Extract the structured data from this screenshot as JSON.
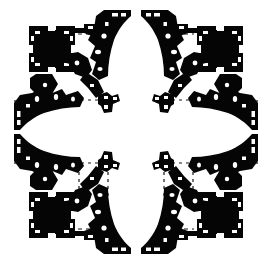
{
  "document": {
    "type": "architectural-floor-plan",
    "title": "Centralized Greek-cross church plan",
    "rendering": "poche",
    "symmetry": "four-fold mirror (vertical and horizontal axes)",
    "colors": {
      "background": "#ffffff",
      "masonry_poche": "#050505",
      "axis_line": "#151515",
      "thin_line": "#2a2a2a"
    },
    "canvas": {
      "width": 272,
      "height": 264
    }
  },
  "plan": {
    "center": {
      "x": 136,
      "y": 132
    },
    "elements": {
      "corner_chapel": "square chapel with four thick corner piers",
      "cross_arm": "curved apsidal arm projecting on each axis",
      "central_pier": "free-standing L-shaped pier block",
      "axis_line": "dashed construction/axis line",
      "niche": "small white recess within pier"
    },
    "labels": {
      "corner_chapel_nw": "corner-chapel-northwest",
      "corner_chapel_ne": "corner-chapel-northeast",
      "corner_chapel_sw": "corner-chapel-southwest",
      "corner_chapel_se": "corner-chapel-southeast",
      "arm_n": "cross-arm-north",
      "arm_s": "cross-arm-south",
      "arm_e": "cross-arm-east",
      "arm_w": "cross-arm-west",
      "crossing": "central-crossing"
    }
  },
  "geometry": {
    "corner_chapel_nw": {
      "chapel_square": {
        "x": 30,
        "y": 27,
        "w": 44,
        "h": 44
      },
      "piers": [
        {
          "x": 30,
          "y": 27,
          "w": 15,
          "h": 15
        },
        {
          "x": 59,
          "y": 27,
          "w": 15,
          "h": 15
        },
        {
          "x": 30,
          "y": 56,
          "w": 15,
          "h": 15
        },
        {
          "x": 59,
          "y": 56,
          "w": 15,
          "h": 15
        }
      ]
    },
    "central_piers": [
      {
        "x": 98,
        "y": 93,
        "w": 21,
        "h": 20,
        "rot": 0
      },
      {
        "x": 153,
        "y": 93,
        "w": 21,
        "h": 20,
        "rot": 90
      },
      {
        "x": 98,
        "y": 151,
        "w": 21,
        "h": 20,
        "rot": 270
      },
      {
        "x": 153,
        "y": 151,
        "w": 21,
        "h": 20,
        "rot": 180
      }
    ],
    "arm_extents": {
      "north_tip_y": 10,
      "south_tip_y": 252,
      "west_tip_x": 14,
      "east_tip_x": 258
    },
    "axis_lines": [
      {
        "name": "north-upper-left",
        "x1": 78,
        "y1": 34,
        "x2": 104,
        "y2": 34
      },
      {
        "name": "north-upper-right",
        "x1": 168,
        "y1": 34,
        "x2": 194,
        "y2": 34
      },
      {
        "name": "south-lower-left",
        "x1": 78,
        "y1": 229,
        "x2": 104,
        "y2": 229
      },
      {
        "name": "south-lower-right",
        "x1": 168,
        "y1": 229,
        "x2": 194,
        "y2": 229
      },
      {
        "name": "west-inner-upper",
        "x1": 37,
        "y1": 74,
        "x2": 37,
        "y2": 96
      },
      {
        "name": "east-inner-upper",
        "x1": 235,
        "y1": 74,
        "x2": 235,
        "y2": 96
      },
      {
        "name": "west-inner-lower",
        "x1": 37,
        "y1": 168,
        "x2": 37,
        "y2": 192
      },
      {
        "name": "east-inner-lower",
        "x1": 235,
        "y1": 168,
        "x2": 235,
        "y2": 192
      },
      {
        "name": "sw-grid-vert-a",
        "x1": 46,
        "y1": 166,
        "x2": 46,
        "y2": 196
      },
      {
        "name": "sw-grid-vert-b",
        "x1": 79,
        "y1": 160,
        "x2": 79,
        "y2": 196
      },
      {
        "name": "sw-grid-vert-c",
        "x1": 108,
        "y1": 160,
        "x2": 108,
        "y2": 196
      },
      {
        "name": "se-grid-vert-a",
        "x1": 226,
        "y1": 166,
        "x2": 226,
        "y2": 196
      },
      {
        "name": "se-grid-vert-b",
        "x1": 193,
        "y1": 160,
        "x2": 193,
        "y2": 196
      },
      {
        "name": "se-grid-vert-c",
        "x1": 164,
        "y1": 160,
        "x2": 164,
        "y2": 196
      },
      {
        "name": "sw-grid-horz",
        "x1": 58,
        "y1": 164,
        "x2": 100,
        "y2": 164
      },
      {
        "name": "se-grid-horz",
        "x1": 172,
        "y1": 164,
        "x2": 214,
        "y2": 164
      },
      {
        "name": "nw-grid-horz",
        "x1": 58,
        "y1": 100,
        "x2": 100,
        "y2": 100
      },
      {
        "name": "ne-grid-horz",
        "x1": 172,
        "y1": 100,
        "x2": 214,
        "y2": 100
      }
    ]
  }
}
